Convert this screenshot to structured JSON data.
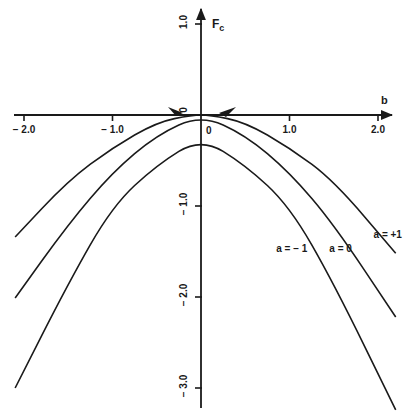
{
  "chart_data": {
    "type": "line",
    "title": "",
    "xlabel": "b",
    "ylabel": "F_c",
    "xlim": [
      -2.2,
      2.2
    ],
    "ylim": [
      -3.3,
      1.2
    ],
    "grid": false,
    "legend_position": "inline",
    "x_ticks": [
      -2.0,
      -1.0,
      0,
      1.0,
      2.0
    ],
    "x_tick_labels": [
      "− 2.0",
      "− 1.0",
      "0",
      "1.0",
      "2.0"
    ],
    "y_ticks": [
      1.0,
      0,
      -1.0,
      -2.0,
      -3.0
    ],
    "y_tick_labels": [
      "1.0",
      "0",
      "− 1.0",
      "− 2.0",
      "− 3.0"
    ],
    "series": [
      {
        "name": "a = +1",
        "x": [
          -2.1,
          -1.5,
          -1.0,
          -0.5,
          -0.1,
          0.1,
          0.5,
          1.0,
          1.5,
          2.2
        ],
        "y": [
          -1.34,
          -0.72,
          -0.36,
          -0.08,
          0.0,
          0.0,
          -0.08,
          -0.36,
          -0.72,
          -1.52
        ]
      },
      {
        "name": "a = 0",
        "x": [
          -2.1,
          -1.5,
          -1.0,
          -0.5,
          0.0,
          0.5,
          1.0,
          1.5,
          2.2
        ],
        "y": [
          -2.01,
          -1.2,
          -0.63,
          -0.22,
          0.0,
          -0.22,
          -0.63,
          -1.2,
          -2.22
        ]
      },
      {
        "name": "a = −1",
        "x": [
          -2.1,
          -1.5,
          -1.0,
          -0.5,
          0.0,
          0.5,
          1.0,
          1.5,
          2.2
        ],
        "y": [
          -3.0,
          -1.85,
          -1.0,
          -0.55,
          -0.25,
          -0.55,
          -1.0,
          -1.85,
          -3.24
        ]
      }
    ],
    "annotations": [
      {
        "text": "a = +1",
        "x": 1.95,
        "y": -1.35
      },
      {
        "text": "a = 0",
        "x": 1.45,
        "y": -1.5
      },
      {
        "text": "a = − 1",
        "x": 0.85,
        "y": -1.5
      }
    ]
  }
}
